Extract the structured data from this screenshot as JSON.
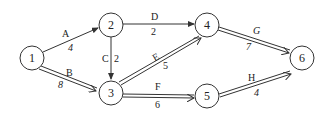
{
  "diagram": {
    "type": "activity-network",
    "nodes": [
      {
        "id": "1",
        "label": "1",
        "x": 32,
        "y": 58
      },
      {
        "id": "2",
        "label": "2",
        "x": 111,
        "y": 25
      },
      {
        "id": "3",
        "label": "3",
        "x": 111,
        "y": 92
      },
      {
        "id": "4",
        "label": "4",
        "x": 207,
        "y": 25
      },
      {
        "id": "5",
        "label": "5",
        "x": 207,
        "y": 97
      },
      {
        "id": "6",
        "label": "6",
        "x": 302,
        "y": 58
      }
    ],
    "edges": [
      {
        "from": "1",
        "to": "2",
        "activity": "A",
        "duration": "4",
        "critical": false
      },
      {
        "from": "1",
        "to": "3",
        "activity": "B",
        "duration": "8",
        "critical": true
      },
      {
        "from": "2",
        "to": "3",
        "activity": "C",
        "duration": "2",
        "critical": false
      },
      {
        "from": "2",
        "to": "4",
        "activity": "D",
        "duration": "2",
        "critical": false
      },
      {
        "from": "3",
        "to": "4",
        "activity": "E",
        "duration": "5",
        "critical": true
      },
      {
        "from": "3",
        "to": "5",
        "activity": "F",
        "duration": "6",
        "critical": true
      },
      {
        "from": "4",
        "to": "6",
        "activity": "G",
        "duration": "7",
        "critical": true
      },
      {
        "from": "5",
        "to": "6",
        "activity": "H",
        "duration": "4",
        "critical": true
      }
    ]
  },
  "colors": {
    "stroke": "#333333",
    "text": "#222222",
    "background": "#ffffff"
  }
}
